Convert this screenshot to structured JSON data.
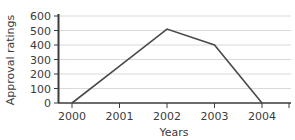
{
  "chart_data": {
    "type": "line",
    "title": "",
    "xlabel": "Years",
    "ylabel": "Approval ratings",
    "categories": [
      "2000",
      "2001",
      "2002",
      "2003",
      "2004"
    ],
    "x": [
      2000,
      2001,
      2002,
      2003,
      2004
    ],
    "values": [
      0,
      255,
      510,
      400,
      0
    ],
    "series": [
      {
        "name": "Approval ratings",
        "values": [
          0,
          255,
          510,
          400,
          0
        ]
      }
    ],
    "xlim": [
      2000,
      2004
    ],
    "ylim": [
      0,
      600
    ],
    "yticks": [
      "0",
      "100",
      "200",
      "300",
      "400",
      "500",
      "600"
    ],
    "ytick_values": [
      0,
      100,
      200,
      300,
      400,
      500,
      600
    ],
    "xticks": [
      "2000",
      "2001",
      "2002",
      "2003",
      "2004"
    ],
    "grid": "horizontal",
    "legend": "none",
    "line_color": "#4a4a4a",
    "grid_color": "#d9d9d9",
    "axis_color": "#3b3b3b",
    "background_color": "#ffffff"
  }
}
